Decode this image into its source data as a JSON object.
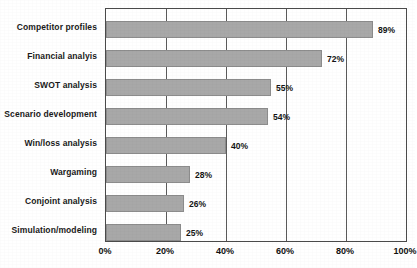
{
  "chart_data": {
    "type": "bar",
    "orientation": "horizontal",
    "title": "",
    "subtitle": "",
    "xlabel": "",
    "ylabel": "",
    "categories": [
      "Competitor profiles",
      "Financial analyis",
      "SWOT analysis",
      "Scenario development",
      "Win/loss analysis",
      "Wargaming",
      "Conjoint analysis",
      "Simulation/modeling"
    ],
    "values": [
      89,
      72,
      55,
      54,
      40,
      28,
      26,
      25
    ],
    "data_labels": [
      "89%",
      "72%",
      "55%",
      "54%",
      "40%",
      "28%",
      "26%",
      "25%"
    ],
    "xlim": [
      0,
      100
    ],
    "xticks": [
      0,
      20,
      40,
      60,
      80,
      100
    ],
    "xtick_labels": [
      "0%",
      "20%",
      "40%",
      "60%",
      "80%",
      "100%"
    ],
    "gridlines": {
      "vertical": [
        20,
        40,
        60,
        80
      ],
      "horizontal": []
    },
    "legend": {
      "visible": false,
      "position": "none",
      "entries": []
    },
    "annotations": [],
    "colors": {
      "bar_fill": "#a8a8a8",
      "bar_stroke": "#8c8c8c",
      "plot_border": "#4a4a4a",
      "gridline": "#5a5a5a",
      "plot_background": "#ffffff",
      "text": "#141414"
    }
  }
}
